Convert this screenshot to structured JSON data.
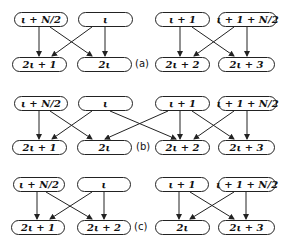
{
  "diagram": {
    "sections": [
      {
        "label": "(a)",
        "top_nodes": [
          "ι + N/2",
          "ι",
          "ι + 1",
          "ι + 1 + N/2"
        ],
        "bottom_nodes": [
          "2ι + 1",
          "2ι",
          "2ι + 2",
          "2ι + 3"
        ],
        "edges": [
          [
            "ι + N/2",
            "2ι + 1"
          ],
          [
            "ι + N/2",
            "2ι"
          ],
          [
            "ι",
            "2ι + 1"
          ],
          [
            "ι",
            "2ι"
          ],
          [
            "ι + 1",
            "2ι + 2"
          ],
          [
            "ι + 1",
            "2ι + 3"
          ],
          [
            "ι + 1 + N/2",
            "2ι + 2"
          ],
          [
            "ι + 1 + N/2",
            "2ι + 3"
          ]
        ]
      },
      {
        "label": "(b)",
        "top_nodes": [
          "ι + N/2",
          "ι",
          "ι + 1",
          "ι + 1 + N/2"
        ],
        "bottom_nodes": [
          "2ι + 1",
          "2ι",
          "2ι + 2",
          "2ι + 3"
        ],
        "edges": [
          [
            "ι + N/2",
            "2ι + 1"
          ],
          [
            "ι + N/2",
            "2ι"
          ],
          [
            "ι",
            "2ι + 1"
          ],
          [
            "ι",
            "2ι + 2"
          ],
          [
            "ι + 1",
            "2ι"
          ],
          [
            "ι + 1",
            "2ι + 2"
          ],
          [
            "ι + 1",
            "2ι + 3"
          ],
          [
            "ι + 1 + N/2",
            "2ι + 2"
          ],
          [
            "ι + 1 + N/2",
            "2ι + 3"
          ]
        ]
      },
      {
        "label": "(c)",
        "top_nodes": [
          "ι + N/2",
          "ι",
          "ι + 1",
          "ι + 1 + N/2"
        ],
        "bottom_nodes": [
          "2ι + 1",
          "2ι + 2",
          "2ι",
          "2ι + 3"
        ],
        "edges": [
          [
            "ι + N/2",
            "2ι + 1"
          ],
          [
            "ι + N/2",
            "2ι + 2"
          ],
          [
            "ι",
            "2ι + 1"
          ],
          [
            "ι",
            "2ι + 2"
          ],
          [
            "ι + 1",
            "2ι"
          ],
          [
            "ι + 1",
            "2ι + 3"
          ],
          [
            "ι + 1 + N/2",
            "2ι"
          ],
          [
            "ι + 1 + N/2",
            "2ι + 3"
          ]
        ]
      }
    ]
  }
}
